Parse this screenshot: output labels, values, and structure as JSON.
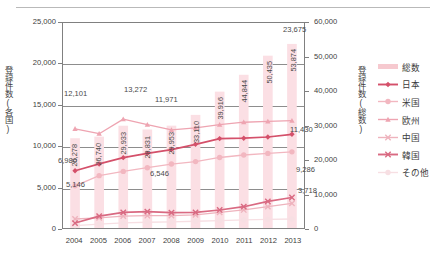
{
  "axes": {
    "left_title": "登録件数(各国)",
    "right_title": "登録件数(総数)",
    "left_ticks": [
      "25,000",
      "20,000",
      "15,000",
      "10,000",
      "5,000",
      "0"
    ],
    "right_ticks": [
      "60,000",
      "50,000",
      "40,000",
      "30,000",
      "20,000",
      "10,000",
      "0"
    ],
    "x_ticks": [
      "2004",
      "2005",
      "2006",
      "2007",
      "2008",
      "2009",
      "2010",
      "2011",
      "2012",
      "2013"
    ]
  },
  "legend": {
    "items": [
      {
        "label": "総数",
        "color": "#f6c9cf",
        "marker": "none"
      },
      {
        "label": "日本",
        "color": "#d4506a",
        "marker": "diamond"
      },
      {
        "label": "米国",
        "color": "#f2b7c0",
        "marker": "circle"
      },
      {
        "label": "欧州",
        "color": "#eea4b1",
        "marker": "triangle"
      },
      {
        "label": "中国",
        "color": "#eeb3bd",
        "marker": "x"
      },
      {
        "label": "韓国",
        "color": "#d96a82",
        "marker": "x"
      },
      {
        "label": "その他",
        "color": "#f7dfe3",
        "marker": "circle"
      }
    ]
  },
  "labels": {
    "bars": [
      "26,278",
      "26,740",
      "29,933",
      "28,831",
      "29,953",
      "33,110",
      "39,916",
      "44,844",
      "50,435",
      "53,874"
    ],
    "callouts": [
      {
        "text": "12,101",
        "x": 64,
        "y": 89
      },
      {
        "text": "13,272",
        "x": 124,
        "y": 85
      },
      {
        "text": "11,971",
        "x": 155,
        "y": 95
      },
      {
        "text": "23,675",
        "x": 283,
        "y": 25
      },
      {
        "text": "6,980",
        "x": 58,
        "y": 156
      },
      {
        "text": "5,146",
        "x": 66,
        "y": 180
      },
      {
        "text": "6,546",
        "x": 150,
        "y": 169
      },
      {
        "text": "11,430",
        "x": 290,
        "y": 125
      },
      {
        "text": "9,286",
        "x": 296,
        "y": 165
      },
      {
        "text": "3,718",
        "x": 298,
        "y": 186
      }
    ]
  },
  "chart_data": {
    "type": "line",
    "title": "",
    "xlabel": "",
    "ylabel": "登録件数(各国)",
    "y2label": "登録件数(総数)",
    "categories": [
      "2004",
      "2005",
      "2006",
      "2007",
      "2008",
      "2009",
      "2010",
      "2011",
      "2012",
      "2013"
    ],
    "ylim": [
      0,
      25000
    ],
    "y2lim": [
      0,
      60000
    ],
    "grid": true,
    "legend_position": "right",
    "background_bars": {
      "name": "総数",
      "axis": "y2",
      "values": [
        26278,
        26740,
        29933,
        28831,
        29953,
        33110,
        39916,
        44844,
        50435,
        53874
      ]
    },
    "series": [
      {
        "name": "総数",
        "axis": "y2",
        "type": "bar",
        "values": [
          26278,
          26740,
          29933,
          28831,
          29953,
          33110,
          39916,
          44844,
          50435,
          53874
        ]
      },
      {
        "name": "日本",
        "axis": "y1",
        "color": "#d4506a",
        "values": [
          6980,
          7810,
          8580,
          9100,
          9550,
          10200,
          10900,
          10950,
          11100,
          11430
        ]
      },
      {
        "name": "米国",
        "axis": "y1",
        "color": "#f2b7c0",
        "values": [
          5146,
          6380,
          6900,
          7350,
          7800,
          8100,
          8600,
          8900,
          9100,
          9286
        ]
      },
      {
        "name": "欧州",
        "axis": "y1",
        "color": "#eea4b1",
        "values": [
          12101,
          11500,
          13272,
          12600,
          11971,
          12200,
          12600,
          12900,
          13000,
          13100
        ]
      },
      {
        "name": "中国",
        "axis": "y1",
        "color": "#eeb3bd",
        "values": [
          1100,
          1250,
          1450,
          1500,
          1520,
          1600,
          1900,
          2200,
          2600,
          3000
        ]
      },
      {
        "name": "韓国",
        "axis": "y1",
        "color": "#d96a82",
        "values": [
          600,
          1450,
          1900,
          2000,
          1880,
          1900,
          2200,
          2600,
          3250,
          3718
        ]
      },
      {
        "name": "その他",
        "axis": "y1",
        "color": "#f7dfe3",
        "values": [
          300,
          480,
          620,
          700,
          740,
          820,
          900,
          1000,
          1050,
          1100
        ]
      }
    ],
    "callout_values": {
      "欧州_2004": 12101,
      "欧州_2006": 13272,
      "欧州_2008": 11971,
      "日本_2004": 6980,
      "日本_2013": 11430,
      "米国_2004": 5146,
      "米国_2008": 6546,
      "米国_2013": 9286,
      "韓国_2013": 3718,
      "総数_2013_right_label": 23675
    }
  }
}
